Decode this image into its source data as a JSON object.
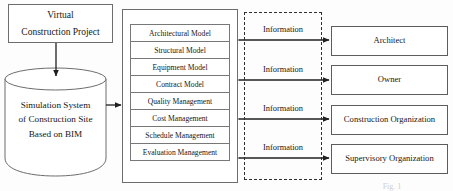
{
  "diagram": {
    "title_caption_remnant": "Fig. 1",
    "source_node": {
      "name": "virtual-construction-project",
      "lines": [
        "Virtual",
        "Construction Project"
      ]
    },
    "datastore": {
      "name": "simulation-system-datastore",
      "lines": [
        "Simulation   System",
        "of Construction Site",
        "Based on BIM"
      ]
    },
    "module_panel": {
      "name": "module-panel",
      "items": [
        {
          "label": "Architectural Model"
        },
        {
          "label": "Structural Model"
        },
        {
          "label": "Equipment Model"
        },
        {
          "label": "Contract Model"
        },
        {
          "label": "Quality Management"
        },
        {
          "label": "Cost Management"
        },
        {
          "label": "Schedule Management"
        },
        {
          "label": "Evaluation Management"
        }
      ]
    },
    "information_flows": [
      {
        "label": "Information",
        "top": 25
      },
      {
        "label": "Information",
        "top": 65
      },
      {
        "label": "Information",
        "top": 104
      },
      {
        "label": "Information",
        "top": 143
      }
    ],
    "stakeholders": [
      {
        "label": "Architect",
        "top": 26
      },
      {
        "label": "Owner",
        "top": 65
      },
      {
        "label": "Construction Organization",
        "top": 105
      },
      {
        "label": "Supervisory Organization",
        "top": 144
      }
    ],
    "colors": {
      "background": "#fdfdfd",
      "box_border": "#6d6d6d",
      "dashed_border": "#2e2e2e",
      "arrow": "#1f1f1f",
      "text": "#171717"
    }
  }
}
